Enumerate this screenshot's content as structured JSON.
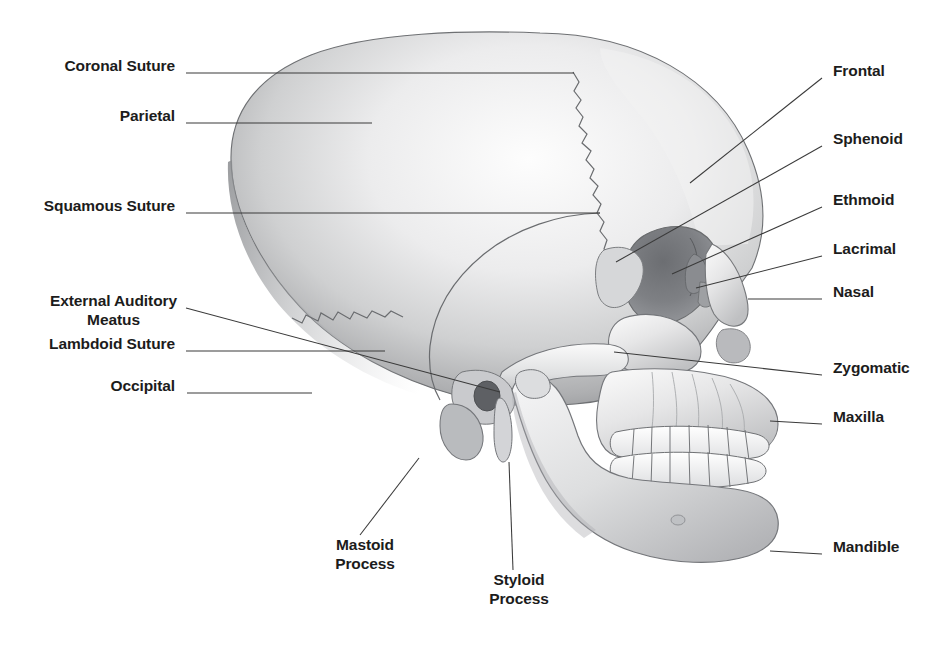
{
  "figure": {
    "background_color": "#ffffff",
    "ink_color": "#1c1c1c",
    "leader_color": "#3a3a3a"
  },
  "labels": {
    "left": [
      {
        "name": "coronal-suture",
        "text": "Coronal Suture",
        "x": 175,
        "y": 65,
        "leader": {
          "x1": 186,
          "y1": 73,
          "x2": 574,
          "y2": 73
        }
      },
      {
        "name": "parietal",
        "text": "Parietal",
        "x": 175,
        "y": 115,
        "leader": {
          "x1": 186,
          "y1": 123,
          "x2": 372,
          "y2": 123
        }
      },
      {
        "name": "squamous-suture",
        "text": "Squamous Suture",
        "x": 175,
        "y": 205,
        "leader": {
          "x1": 186,
          "y1": 213,
          "x2": 600,
          "y2": 213
        }
      },
      {
        "name": "lambdoid-suture",
        "text": "Lambdoid Suture",
        "x": 175,
        "y": 343,
        "leader": {
          "x1": 186,
          "y1": 351,
          "x2": 385,
          "y2": 351
        }
      },
      {
        "name": "occipital",
        "text": "Occipital",
        "x": 175,
        "y": 385,
        "leader": {
          "x1": 187,
          "y1": 393,
          "x2": 312,
          "y2": 393
        }
      }
    ],
    "left_multiline": [
      {
        "name": "external-auditory-meatus",
        "line1": "External Auditory",
        "line2": "Meatus",
        "x": 175,
        "y": 300,
        "leader": {
          "x1": 186,
          "y1": 308,
          "x2": 500,
          "y2": 392
        }
      }
    ],
    "right": [
      {
        "name": "frontal",
        "text": "Frontal",
        "x": 833,
        "y": 70,
        "leader": {
          "x1": 822,
          "y1": 78,
          "x2": 690,
          "y2": 183
        }
      },
      {
        "name": "sphenoid",
        "text": "Sphenoid",
        "x": 833,
        "y": 138,
        "leader": {
          "x1": 822,
          "y1": 146,
          "x2": 616,
          "y2": 262
        }
      },
      {
        "name": "ethmoid",
        "text": "Ethmoid",
        "x": 833,
        "y": 199,
        "leader": {
          "x1": 822,
          "y1": 207,
          "x2": 672,
          "y2": 274
        }
      },
      {
        "name": "lacrimal",
        "text": "Lacrimal",
        "x": 833,
        "y": 248,
        "leader": {
          "x1": 822,
          "y1": 256,
          "x2": 696,
          "y2": 288
        }
      },
      {
        "name": "nasal",
        "text": "Nasal",
        "x": 833,
        "y": 291,
        "leader": {
          "x1": 822,
          "y1": 299,
          "x2": 748,
          "y2": 299
        }
      },
      {
        "name": "zygomatic",
        "text": "Zygomatic",
        "x": 833,
        "y": 367,
        "leader": {
          "x1": 822,
          "y1": 375,
          "x2": 614,
          "y2": 352
        }
      },
      {
        "name": "maxilla",
        "text": "Maxilla",
        "x": 833,
        "y": 416,
        "leader": {
          "x1": 822,
          "y1": 424,
          "x2": 770,
          "y2": 421
        }
      },
      {
        "name": "mandible",
        "text": "Mandible",
        "x": 833,
        "y": 546,
        "leader": {
          "x1": 822,
          "y1": 554,
          "x2": 770,
          "y2": 551
        }
      }
    ],
    "bottom": [
      {
        "name": "mastoid-process",
        "line1": "Mastoid",
        "line2": "Process",
        "x": 365,
        "y": 543,
        "leader": {
          "x1": 360,
          "y1": 535,
          "x2": 419,
          "y2": 458
        }
      },
      {
        "name": "styloid-process",
        "line1": "Styloid",
        "line2": "Process",
        "x": 519,
        "y": 578,
        "leader": {
          "x1": 513,
          "y1": 570,
          "x2": 509,
          "y2": 462
        }
      }
    ]
  },
  "skull": {
    "parts": [
      "cranial-vault",
      "frontal-bone",
      "parietal-bone",
      "occipital-bone",
      "temporal-bone",
      "sphenoid-bone",
      "ethmoid-bone",
      "lacrimal-bone",
      "nasal-bone",
      "zygomatic-bone",
      "maxilla-bone",
      "mandible-bone",
      "orbit",
      "external-auditory-meatus",
      "mastoid-process",
      "styloid-process",
      "zygomatic-arch",
      "upper-teeth",
      "lower-teeth"
    ],
    "sutures": [
      "coronal-suture",
      "squamous-suture",
      "lambdoid-suture"
    ],
    "upper_teeth_count": 8,
    "lower_teeth_count": 8
  }
}
